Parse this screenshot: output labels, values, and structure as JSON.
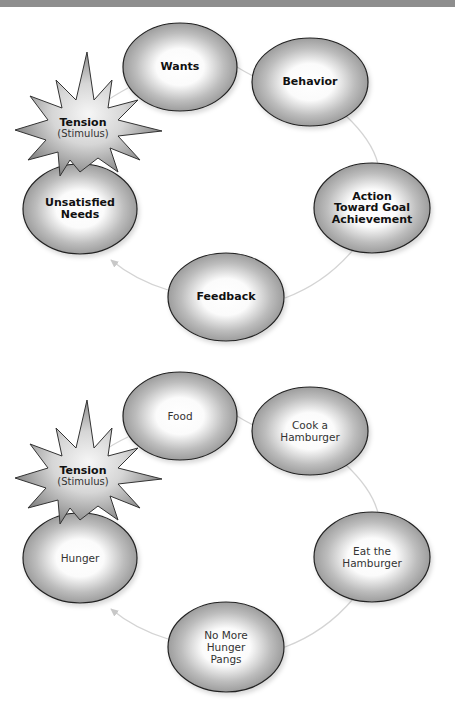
{
  "diagrams": [
    {
      "id": "general",
      "tension": {
        "title": "Tension",
        "subtitle": "(Stimulus)"
      },
      "nodes": [
        {
          "label": "Wants"
        },
        {
          "label": "Behavior"
        },
        {
          "label": "Action\nToward Goal\nAchievement"
        },
        {
          "label": "Feedback"
        },
        {
          "label": "Unsatisfied\nNeeds"
        }
      ]
    },
    {
      "id": "example",
      "tension": {
        "title": "Tension",
        "subtitle": "(Stimulus)"
      },
      "nodes": [
        {
          "label": "Food"
        },
        {
          "label": "Cook a\nHamburger"
        },
        {
          "label": "Eat the\nHamburger"
        },
        {
          "label": "No More\nHunger\nPangs"
        },
        {
          "label": "Hunger"
        }
      ]
    }
  ],
  "colors": {
    "ellipse_edge": "#8a8a8a",
    "ellipse_center": "#ffffff",
    "outline": "#222222",
    "connector": "#d4d4d4",
    "header_bar": "#8e8e8e"
  }
}
